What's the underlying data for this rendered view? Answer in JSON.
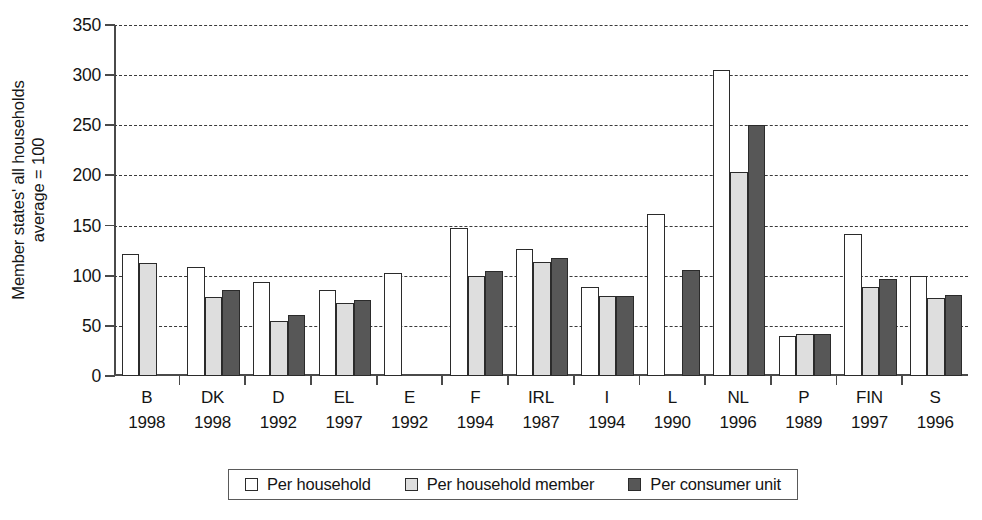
{
  "chart_data": {
    "type": "bar",
    "title": "",
    "subtitle": "",
    "xlabel": "",
    "ylabel": "Member states' all households\naverage = 100",
    "ylim": [
      0,
      350
    ],
    "ytick_values": [
      0,
      50,
      100,
      150,
      200,
      250,
      300,
      350
    ],
    "ytick_labels": [
      "0",
      "50",
      "100",
      "150",
      "200",
      "250",
      "300",
      "350"
    ],
    "grid": "horizontal-dashed",
    "legend_position": "bottom-center",
    "categories": [
      "B",
      "DK",
      "D",
      "EL",
      "E",
      "F",
      "IRL",
      "I",
      "L",
      "NL",
      "P",
      "FIN",
      "S"
    ],
    "category_years": [
      "1998",
      "1998",
      "1992",
      "1997",
      "1992",
      "1994",
      "1987",
      "1994",
      "1990",
      "1996",
      "1989",
      "1997",
      "1996"
    ],
    "series": [
      {
        "name": "Per household",
        "color": "#ffffff",
        "values": [
          122,
          109,
          94,
          86,
          103,
          148,
          127,
          89,
          162,
          305,
          40,
          142,
          100
        ]
      },
      {
        "name": "Per household member",
        "color": "#dedede",
        "values": [
          113,
          79,
          55,
          73,
          null,
          100,
          114,
          80,
          null,
          203,
          42,
          89,
          78
        ]
      },
      {
        "name": "Per consumer unit",
        "color": "#575757",
        "values": [
          null,
          86,
          61,
          76,
          null,
          105,
          118,
          80,
          106,
          250,
          42,
          97,
          81
        ]
      }
    ]
  },
  "legend": {
    "items": [
      {
        "label": "Per household",
        "swatch": "white-square-icon"
      },
      {
        "label": "Per household member",
        "swatch": "light-gray-square-icon"
      },
      {
        "label": "Per consumer unit",
        "swatch": "dark-gray-square-icon"
      }
    ]
  },
  "axes": {
    "y_title": "Member states' all households\naverage = 100"
  }
}
